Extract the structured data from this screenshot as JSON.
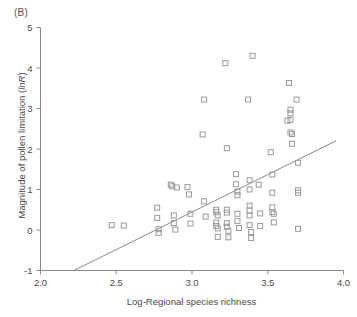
{
  "figure": {
    "panel_label": "(B)",
    "marker_color": "#9a9a9a",
    "line_color": "#8a8a8a",
    "axis_color": "#8a8a8a",
    "text_color": "#4a4a4a",
    "background": "#ffffff"
  },
  "chart_data": {
    "type": "scatter",
    "title": "",
    "panel": "(B)",
    "xlabel": "Log-Regional species richness",
    "ylabel": "Magnitude of pollen limitation (lnR)",
    "ylabel_plain": "Magnitude of pollen limitation (",
    "ylabel_italic": "lnR",
    "ylabel_tail": ")",
    "xlim": [
      2.0,
      4.0
    ],
    "ylim": [
      -1,
      5
    ],
    "xticks": [
      2.0,
      2.5,
      3.0,
      3.5,
      4.0
    ],
    "xticklabels": [
      "2.0",
      "2.5",
      "3.0",
      "3.5",
      "4.0"
    ],
    "yticks": [
      -1,
      0,
      1,
      2,
      3,
      4,
      5
    ],
    "yticklabels": [
      "-1",
      "0",
      "1",
      "2",
      "3",
      "4",
      "5"
    ],
    "grid": false,
    "legend": false,
    "marker_style": "open-square",
    "marker_size": 5,
    "trendline": {
      "type": "linear-fit",
      "x_start": 2.22,
      "y_start": -1.0,
      "x_end": 3.95,
      "y_end": 2.2,
      "slope": 1.85,
      "intercept": -5.11
    },
    "points": [
      [
        2.47,
        0.12
      ],
      [
        2.55,
        0.11
      ],
      [
        2.77,
        0.55
      ],
      [
        2.77,
        0.3
      ],
      [
        2.78,
        0.02
      ],
      [
        2.78,
        -0.07
      ],
      [
        2.86,
        1.12
      ],
      [
        2.87,
        1.08
      ],
      [
        2.88,
        0.36
      ],
      [
        2.88,
        0.17
      ],
      [
        2.89,
        0.01
      ],
      [
        2.9,
        1.05
      ],
      [
        2.97,
        1.06
      ],
      [
        2.98,
        0.88
      ],
      [
        2.99,
        0.4
      ],
      [
        2.99,
        0.16
      ],
      [
        3.07,
        2.36
      ],
      [
        3.08,
        3.22
      ],
      [
        3.08,
        0.71
      ],
      [
        3.09,
        0.33
      ],
      [
        3.16,
        0.5
      ],
      [
        3.16,
        0.44
      ],
      [
        3.16,
        0.18
      ],
      [
        3.16,
        0.1
      ],
      [
        3.17,
        0.04
      ],
      [
        3.17,
        -0.17
      ],
      [
        3.17,
        0.36
      ],
      [
        3.22,
        4.12
      ],
      [
        3.23,
        2.02
      ],
      [
        3.23,
        0.5
      ],
      [
        3.23,
        0.43
      ],
      [
        3.23,
        0.17
      ],
      [
        3.23,
        0.08
      ],
      [
        3.24,
        -0.02
      ],
      [
        3.24,
        -0.18
      ],
      [
        3.29,
        1.38
      ],
      [
        3.29,
        1.13
      ],
      [
        3.3,
        0.95
      ],
      [
        3.3,
        0.86
      ],
      [
        3.3,
        0.4
      ],
      [
        3.3,
        0.22
      ],
      [
        3.31,
        0.05
      ],
      [
        3.37,
        3.22
      ],
      [
        3.38,
        1.23
      ],
      [
        3.38,
        1.0
      ],
      [
        3.38,
        0.6
      ],
      [
        3.38,
        0.48
      ],
      [
        3.38,
        0.36
      ],
      [
        3.38,
        0.12
      ],
      [
        3.39,
        -0.05
      ],
      [
        3.39,
        -0.2
      ],
      [
        3.4,
        4.3
      ],
      [
        3.44,
        1.12
      ],
      [
        3.45,
        0.41
      ],
      [
        3.45,
        0.1
      ],
      [
        3.52,
        1.92
      ],
      [
        3.53,
        1.37
      ],
      [
        3.53,
        0.92
      ],
      [
        3.53,
        0.56
      ],
      [
        3.53,
        0.44
      ],
      [
        3.54,
        0.4
      ],
      [
        3.54,
        0.19
      ],
      [
        3.64,
        3.63
      ],
      [
        3.65,
        2.97
      ],
      [
        3.65,
        2.88
      ],
      [
        3.65,
        2.72
      ],
      [
        3.65,
        2.41
      ],
      [
        3.66,
        2.37
      ],
      [
        3.66,
        2.13
      ],
      [
        3.63,
        2.7
      ],
      [
        3.69,
        3.22
      ],
      [
        3.7,
        1.66
      ],
      [
        3.7,
        0.98
      ],
      [
        3.7,
        0.92
      ],
      [
        3.7,
        0.03
      ]
    ]
  }
}
